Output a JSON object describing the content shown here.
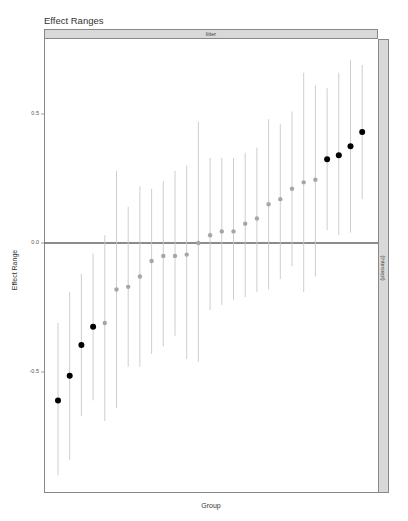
{
  "chart_data": {
    "type": "scatter",
    "subtype": "point-range (caterpillar) plot",
    "title": "Effect Ranges",
    "facet_top": "litter",
    "facet_right": "(Intercept)",
    "xlabel": "Group",
    "ylabel": "Effect Range",
    "yticks": [
      0.5,
      0.0,
      -0.5
    ],
    "ytick_labels": [
      "0.5",
      "0.0",
      "-0.5"
    ],
    "ylim": [
      -0.98,
      0.8
    ],
    "grid": false,
    "reference_line": 0.0,
    "legend": null,
    "colors": {
      "significant": "#000000",
      "non_significant": "#a6a6a6",
      "interval": "#c8c8c8",
      "zero_line": "#666666"
    },
    "points": [
      {
        "index": 1,
        "estimate": -0.61,
        "lower": -0.9,
        "upper": -0.31,
        "significant": true
      },
      {
        "index": 2,
        "estimate": -0.515,
        "lower": -0.84,
        "upper": -0.19,
        "significant": true
      },
      {
        "index": 3,
        "estimate": -0.395,
        "lower": -0.67,
        "upper": -0.12,
        "significant": true
      },
      {
        "index": 4,
        "estimate": -0.325,
        "lower": -0.61,
        "upper": -0.04,
        "significant": true
      },
      {
        "index": 5,
        "estimate": -0.31,
        "lower": -0.69,
        "upper": 0.03,
        "significant": false
      },
      {
        "index": 6,
        "estimate": -0.18,
        "lower": -0.64,
        "upper": 0.28,
        "significant": false
      },
      {
        "index": 7,
        "estimate": -0.17,
        "lower": -0.48,
        "upper": 0.14,
        "significant": false
      },
      {
        "index": 8,
        "estimate": -0.13,
        "lower": -0.48,
        "upper": 0.22,
        "significant": false
      },
      {
        "index": 9,
        "estimate": -0.07,
        "lower": -0.43,
        "upper": 0.21,
        "significant": false
      },
      {
        "index": 10,
        "estimate": -0.05,
        "lower": -0.4,
        "upper": 0.24,
        "significant": false
      },
      {
        "index": 11,
        "estimate": -0.05,
        "lower": -0.36,
        "upper": 0.28,
        "significant": false
      },
      {
        "index": 12,
        "estimate": -0.045,
        "lower": -0.45,
        "upper": 0.3,
        "significant": false
      },
      {
        "index": 13,
        "estimate": 0.0,
        "lower": -0.46,
        "upper": 0.47,
        "significant": false
      },
      {
        "index": 14,
        "estimate": 0.03,
        "lower": -0.26,
        "upper": 0.33,
        "significant": false
      },
      {
        "index": 15,
        "estimate": 0.045,
        "lower": -0.24,
        "upper": 0.33,
        "significant": false
      },
      {
        "index": 16,
        "estimate": 0.045,
        "lower": -0.22,
        "upper": 0.33,
        "significant": false
      },
      {
        "index": 17,
        "estimate": 0.075,
        "lower": -0.21,
        "upper": 0.35,
        "significant": false
      },
      {
        "index": 18,
        "estimate": 0.095,
        "lower": -0.19,
        "upper": 0.37,
        "significant": false
      },
      {
        "index": 19,
        "estimate": 0.15,
        "lower": -0.18,
        "upper": 0.48,
        "significant": false
      },
      {
        "index": 20,
        "estimate": 0.17,
        "lower": -0.14,
        "upper": 0.46,
        "significant": false
      },
      {
        "index": 21,
        "estimate": 0.21,
        "lower": -0.09,
        "upper": 0.51,
        "significant": false
      },
      {
        "index": 22,
        "estimate": 0.235,
        "lower": -0.19,
        "upper": 0.66,
        "significant": false
      },
      {
        "index": 23,
        "estimate": 0.245,
        "lower": -0.13,
        "upper": 0.61,
        "significant": false
      },
      {
        "index": 24,
        "estimate": 0.325,
        "lower": 0.05,
        "upper": 0.6,
        "significant": true
      },
      {
        "index": 25,
        "estimate": 0.34,
        "lower": 0.03,
        "upper": 0.66,
        "significant": true
      },
      {
        "index": 26,
        "estimate": 0.375,
        "lower": 0.04,
        "upper": 0.71,
        "significant": true
      },
      {
        "index": 27,
        "estimate": 0.43,
        "lower": 0.17,
        "upper": 0.69,
        "significant": true
      }
    ]
  }
}
